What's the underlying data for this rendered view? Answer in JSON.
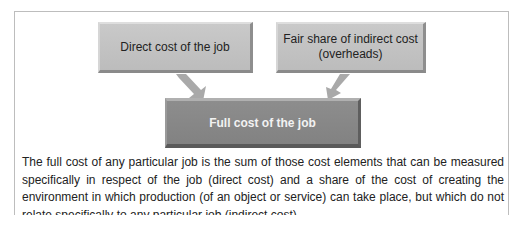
{
  "diagram": {
    "boxes": {
      "direct": {
        "label": "Direct cost of the job"
      },
      "indirect": {
        "label_line1": "Fair share of indirect cost",
        "label_line2": "(overheads)"
      },
      "full": {
        "label": "Full cost of the job"
      }
    },
    "arrows": [
      {
        "from": "direct",
        "to": "full"
      },
      {
        "from": "indirect",
        "to": "full"
      }
    ],
    "colors": {
      "top_box": "#c4c4c4",
      "bottom_box": "#888888",
      "arrow": "#a8a8a8",
      "frame": "#bdbdbd"
    }
  },
  "caption": {
    "text": "The full cost of any particular job is the sum of those cost elements that can be measured specifically in respect of the job (direct cost) and a share of the cost of creating the environment in which production (of an object or service) can take place, but which do not relate specifically to any particular job (indirect cost)."
  }
}
